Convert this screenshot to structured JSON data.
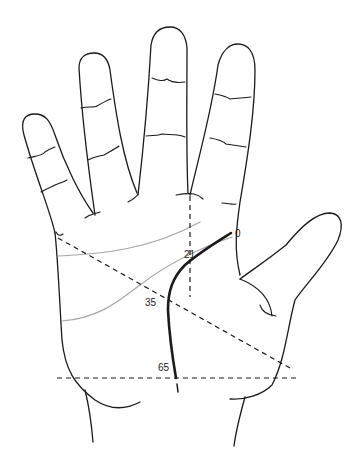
{
  "diagram": {
    "age_markers": [
      {
        "label": "0",
        "x": 235,
        "y": 236
      },
      {
        "label": "21",
        "x": 185,
        "y": 258
      },
      {
        "label": "35",
        "x": 146,
        "y": 305
      },
      {
        "label": "65",
        "x": 160,
        "y": 370
      }
    ],
    "colors": {
      "outline": "#1a1a1a",
      "minor_lines": "#a6a6a6",
      "fate_line": "#1a1a1a",
      "background": "#ffffff"
    },
    "lines": {
      "fate_line": "thick black line from age 0 at base of index/middle junction down to wrist at age 65",
      "vertical_dashed": "from middle/ring finger junction down to age 21",
      "diagonal_dashed": "from little finger side to thumb base, crossing at age 35",
      "horizontal_dashed": "across wrist at age 65"
    }
  }
}
